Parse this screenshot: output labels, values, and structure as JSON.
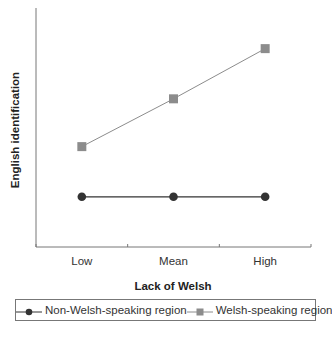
{
  "chart_data": {
    "type": "line",
    "title": "",
    "xlabel": "Lack of Welsh",
    "ylabel": "English identification",
    "categories": [
      "Low",
      "Mean",
      "High"
    ],
    "ylim": [
      0,
      1
    ],
    "y_ticks_labeled": false,
    "grid": false,
    "legend_position": "bottom",
    "series": [
      {
        "name": "Non-Welsh-speaking region",
        "marker": "circle",
        "color": "#333333",
        "values": [
          0.21,
          0.21,
          0.21
        ]
      },
      {
        "name": "Welsh-speaking region",
        "marker": "square",
        "color": "#8c8c8c",
        "values": [
          0.42,
          0.62,
          0.83
        ]
      }
    ]
  },
  "legend": {
    "items": [
      {
        "label": "Non-Welsh-speaking region"
      },
      {
        "label": "Welsh-speaking region"
      }
    ]
  }
}
